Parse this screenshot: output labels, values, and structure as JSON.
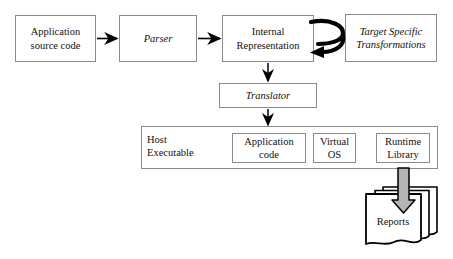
{
  "diagram": {
    "colors": {
      "background": "#ffffff",
      "box_border": "#8a8a8a",
      "text": "#111111",
      "arrow": "#000000",
      "block_arrow_fill": "#b4b4b4"
    },
    "nodes": {
      "application_source_code": {
        "label": "Application\nsource code",
        "line1": "Application",
        "line2": "source code",
        "style": "regular"
      },
      "parser": {
        "label": "Parser",
        "style": "italic"
      },
      "internal_representation": {
        "label": "Internal\nRepresentation",
        "line1": "Internal",
        "line2": "Representation",
        "style": "regular"
      },
      "target_specific_transformations": {
        "label": "Target Specific\nTransformations",
        "line1": "Target Specific",
        "line2": "Transformations",
        "style": "italic"
      },
      "translator": {
        "label": "Translator",
        "style": "italic"
      },
      "host_executable": {
        "label": "Host\nExecutable",
        "line1": "Host",
        "line2": "Executable",
        "style": "regular"
      },
      "application_code": {
        "label": "Application\ncode",
        "line1": "Application",
        "line2": "code",
        "style": "regular"
      },
      "virtual_os": {
        "label": "Virtual\nOS",
        "line1": "Virtual",
        "line2": "OS",
        "style": "regular"
      },
      "runtime_library": {
        "label": "Runtime\nLibrary",
        "line1": "Runtime",
        "line2": "Library",
        "style": "regular"
      },
      "reports": {
        "label": "Reports",
        "style": "regular"
      }
    },
    "edges": [
      {
        "from": "application_source_code",
        "to": "parser",
        "kind": "thin-arrow",
        "direction": "right"
      },
      {
        "from": "parser",
        "to": "internal_representation",
        "kind": "thin-arrow",
        "direction": "right"
      },
      {
        "from": "internal_representation",
        "to": "target_specific_transformations",
        "kind": "thick-loop-arrow",
        "direction": "round-trip"
      },
      {
        "from": "internal_representation",
        "to": "translator",
        "kind": "thin-arrow",
        "direction": "down"
      },
      {
        "from": "translator",
        "to": "host_executable",
        "kind": "thin-arrow",
        "direction": "down"
      },
      {
        "from": "runtime_library",
        "to": "reports",
        "kind": "block-arrow",
        "direction": "down"
      }
    ]
  }
}
